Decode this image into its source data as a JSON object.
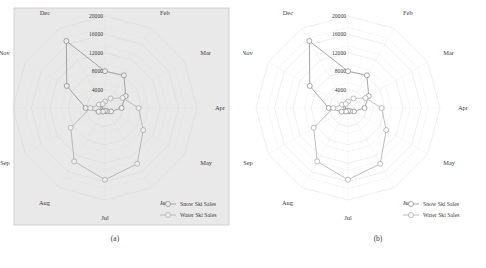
{
  "figure": {
    "subfigures": [
      {
        "id": "a",
        "caption": "(a)",
        "background": "#e9e9e9",
        "has_panel_frame": true
      },
      {
        "id": "b",
        "caption": "(b)",
        "background": "#ffffff",
        "has_panel_frame": false
      }
    ]
  },
  "legend": {
    "items": [
      {
        "label": "Snow Ski Sales",
        "color": "#8a8a8a",
        "marker": "circle-open"
      },
      {
        "label": "Water Ski Sales",
        "color": "#a8a8a8",
        "marker": "circle-open"
      }
    ]
  },
  "chart_data": {
    "type": "line",
    "subtype": "radar",
    "title": "",
    "xlabel": "",
    "ylabel": "",
    "grid": true,
    "legend_position": "bottom-right",
    "categories": [
      "Jan",
      "Feb",
      "Mar",
      "Apr",
      "May",
      "Jun",
      "Jul",
      "Aug",
      "Sep",
      "Oct",
      "Nov",
      "Dec"
    ],
    "tick_labels": [
      "0",
      "4000",
      "8000",
      "12000",
      "16000",
      "20000"
    ],
    "tick_values": [
      0,
      4000,
      8000,
      12000,
      16000,
      20000
    ],
    "rlim": [
      0,
      20000
    ],
    "series": [
      {
        "name": "Snow Ski Sales",
        "color": "#8a8a8a",
        "values": [
          8000,
          8200,
          5200,
          3600,
          1500,
          800,
          600,
          900,
          1600,
          4200,
          9600,
          16800
        ]
      },
      {
        "name": "Water Ski Sales",
        "color": "#a8a8a8",
        "values": [
          1400,
          2400,
          4400,
          7300,
          9600,
          14000,
          15600,
          13400,
          8600,
          3200,
          1500,
          1000
        ]
      }
    ]
  }
}
